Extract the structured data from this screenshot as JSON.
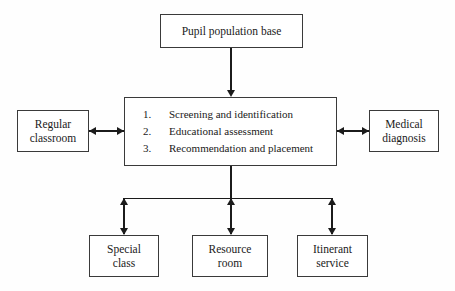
{
  "diagram": {
    "background_color": "#fefefe",
    "line_color": "#1b1b1b",
    "box_border_color": "#3a3a3a",
    "nodes": {
      "top": {
        "label": "Pupil population base"
      },
      "center": {
        "steps": [
          "Screening and identification",
          "Educational assessment",
          "Recommendation and placement"
        ]
      },
      "left": {
        "label": "Regular\nclassroom"
      },
      "right": {
        "label": "Medical\ndiagnosis"
      },
      "bottom": [
        {
          "label": "Special\nclass"
        },
        {
          "label": "Resource\nroom"
        },
        {
          "label": "Itinerant\nservice"
        }
      ]
    },
    "connectors": [
      {
        "name": "top-to-center",
        "kind": "arrow-down",
        "direction": "one-way"
      },
      {
        "name": "left-to-center",
        "kind": "horizontal",
        "direction": "two-way"
      },
      {
        "name": "center-to-right",
        "kind": "horizontal",
        "direction": "two-way"
      },
      {
        "name": "center-to-bottom-bus",
        "kind": "vertical-bus",
        "direction": "two-way"
      }
    ]
  }
}
